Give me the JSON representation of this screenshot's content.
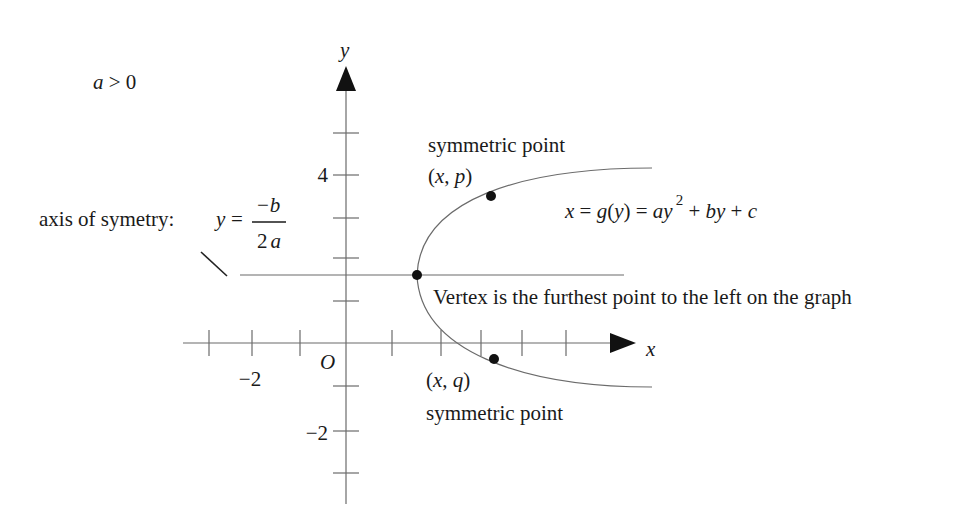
{
  "condition": {
    "var": "a",
    "text": " > 0"
  },
  "axes": {
    "x_label": "x",
    "y_label": "y",
    "origin_label": "O",
    "x_tick_labels": [
      {
        "value": -2,
        "text": "−2"
      }
    ],
    "y_tick_labels": [
      {
        "value": 4,
        "text": "4"
      },
      {
        "value": -2,
        "text": "−2"
      }
    ]
  },
  "axis_of_symmetry": {
    "label": "axis of symetry:",
    "lhs": "y",
    "eq": "=",
    "numerator": "−b",
    "denominator_num": "2",
    "denominator_var": "a"
  },
  "equation": {
    "x": "x",
    "eq1": " = ",
    "g": "g",
    "paren_open": "(",
    "y": "y",
    "paren_close": ")",
    "eq2": " = ",
    "a": "a",
    "y2": "y",
    "exp": "2",
    "plus1": " + ",
    "b": "b",
    "y3": "y",
    "plus2": " + ",
    "c": "c"
  },
  "points": {
    "upper": {
      "label_top": "symmetric point",
      "coord_open": "(",
      "coord_x": "x",
      "coord_sep": ", ",
      "coord_var": "p",
      "coord_close": ")"
    },
    "lower": {
      "label_bottom": "symmetric point",
      "coord_open": "(",
      "coord_x": "x",
      "coord_sep": ", ",
      "coord_var": "q",
      "coord_close": ")"
    },
    "vertex": {
      "note": "Vertex is the furthest point to the left on the graph"
    }
  },
  "colors": {
    "ink": "#1a1a1a",
    "lines": "#6b6b6b",
    "background": "#ffffff"
  }
}
